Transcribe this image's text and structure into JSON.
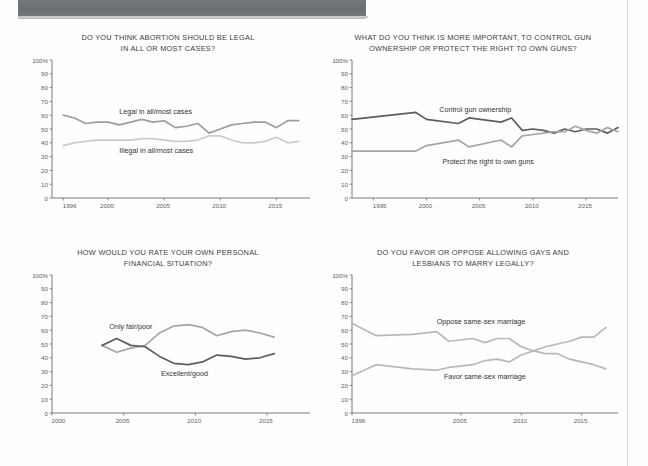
{
  "page": {
    "banner_color": "#6f7376",
    "background": "#ffffff"
  },
  "charts": [
    {
      "id": "abortion-legal",
      "title": "DO YOU THINK ABORTION SHOULD BE LEGAL\nIN ALL OR MOST CASES?",
      "y_ticks": [
        "100%",
        "90",
        "80",
        "70",
        "60",
        "50",
        "40",
        "30",
        "20",
        "10",
        "0"
      ],
      "x_ticks": [
        "1996",
        "2000",
        "2005",
        "2010",
        "2015"
      ],
      "chart_data": {
        "type": "line",
        "title": "DO YOU THINK ABORTION SHOULD BE LEGAL IN ALL OR MOST CASES?",
        "xlabel": "",
        "ylabel": "",
        "xlim": [
          1995,
          2018
        ],
        "ylim": [
          0,
          100
        ],
        "grid": false,
        "legend": "inline-labels",
        "x_ticks": [
          1996,
          2000,
          2005,
          2010,
          2015
        ],
        "y_ticks": [
          0,
          10,
          20,
          30,
          40,
          50,
          60,
          70,
          80,
          90,
          100
        ],
        "series": [
          {
            "name": "Legal in all/most cases",
            "color": "#9a9ea1",
            "label_x": 2001.0,
            "label_y": 62,
            "x": [
              1996,
              1997,
              1998,
              1999,
              2000,
              2001,
              2002,
              2003,
              2004,
              2005,
              2006,
              2007,
              2008,
              2009,
              2010,
              2011,
              2012,
              2013,
              2014,
              2015,
              2016,
              2017
            ],
            "values": [
              60,
              58,
              54,
              55,
              55,
              53,
              55,
              57,
              55,
              56,
              51,
              52,
              54,
              47,
              50,
              53,
              54,
              55,
              55,
              51,
              56,
              56
            ]
          },
          {
            "name": "Illegal in all/most cases",
            "color": "#c9cbce",
            "label_x": 2001.0,
            "label_y": 34,
            "x": [
              1996,
              1997,
              1998,
              1999,
              2000,
              2001,
              2002,
              2003,
              2004,
              2005,
              2006,
              2007,
              2008,
              2009,
              2010,
              2011,
              2012,
              2013,
              2014,
              2015,
              2016,
              2017
            ],
            "values": [
              38,
              40,
              41,
              42,
              42,
              42,
              42,
              43,
              43,
              42,
              41,
              41,
              42,
              45,
              45,
              42,
              40,
              40,
              41,
              44,
              40,
              41
            ]
          }
        ]
      }
    },
    {
      "id": "gun-control",
      "title": "WHAT DO YOU THINK IS MORE IMPORTANT, TO CONTROL GUN\nOWNERSHIP OR PROTECT THE RIGHT TO OWN GUNS?",
      "y_ticks": [
        "100%",
        "90",
        "80",
        "70",
        "60",
        "50",
        "40",
        "30",
        "20",
        "10",
        "0"
      ],
      "x_ticks": [
        "1995",
        "2000",
        "2005",
        "2010",
        "2015"
      ],
      "chart_data": {
        "type": "line",
        "title": "WHAT DO YOU THINK IS MORE IMPORTANT, TO CONTROL GUN OWNERSHIP OR PROTECT THE RIGHT TO OWN GUNS?",
        "xlabel": "",
        "ylabel": "",
        "xlim": [
          1993,
          2018
        ],
        "ylim": [
          0,
          100
        ],
        "grid": false,
        "legend": "inline-labels",
        "x_ticks": [
          1995,
          2000,
          2005,
          2010,
          2015
        ],
        "y_ticks": [
          0,
          10,
          20,
          30,
          40,
          50,
          60,
          70,
          80,
          90,
          100
        ],
        "series": [
          {
            "name": "Control gun ownership",
            "color": "#5b5e61",
            "label_x": 2001.2,
            "label_y": 64,
            "x": [
              1993,
              1999,
              2000,
              2003,
              2004,
              2007,
              2008,
              2009,
              2010,
              2011,
              2012,
              2013,
              2014,
              2015,
              2016,
              2017,
              2018
            ],
            "values": [
              57,
              62,
              57,
              54,
              58,
              55,
              58,
              49,
              50,
              49,
              47,
              50,
              48,
              50,
              50,
              47,
              51
            ]
          },
          {
            "name": "Protect the right to own guns",
            "color": "#a3a6a9",
            "label_x": 2001.5,
            "label_y": 26,
            "x": [
              1993,
              1999,
              2000,
              2003,
              2004,
              2007,
              2008,
              2009,
              2010,
              2011,
              2012,
              2013,
              2014,
              2015,
              2016,
              2017,
              2018
            ],
            "values": [
              34,
              34,
              38,
              42,
              37,
              42,
              37,
              45,
              46,
              47,
              48,
              48,
              52,
              49,
              47,
              51,
              48
            ]
          }
        ]
      }
    },
    {
      "id": "personal-finances",
      "title": "HOW WOULD YOU RATE YOUR OWN PERSONAL\nFINANCIAL SITUATION?",
      "y_ticks": [
        "100%",
        "90",
        "80",
        "70",
        "60",
        "50",
        "40",
        "30",
        "20",
        "10",
        "0"
      ],
      "x_ticks": [
        "2000",
        "2005",
        "2010",
        "2015"
      ],
      "chart_data": {
        "type": "line",
        "title": "HOW WOULD YOU RATE YOUR OWN PERSONAL FINANCIAL SITUATION?",
        "xlabel": "",
        "ylabel": "",
        "xlim": [
          2000,
          2018
        ],
        "ylim": [
          0,
          100
        ],
        "grid": false,
        "legend": "inline-labels",
        "x_ticks": [
          2000,
          2005,
          2010,
          2015
        ],
        "y_ticks": [
          0,
          10,
          20,
          30,
          40,
          50,
          60,
          70,
          80,
          90,
          100
        ],
        "series": [
          {
            "name": "Only fair/poor",
            "color": "#a3a6a9",
            "label_x": 2004.0,
            "label_y": 62,
            "x": [
              2003.5,
              2004.5,
              2005.5,
              2006.5,
              2007.5,
              2008.5,
              2009.5,
              2010.5,
              2011.5,
              2012.5,
              2013.5,
              2014.5,
              2015.5
            ],
            "values": [
              49,
              44,
              47,
              49,
              58,
              63,
              64,
              62,
              56,
              59,
              60,
              58,
              55
            ]
          },
          {
            "name": "Excellent/good",
            "color": "#5b5e61",
            "label_x": 2007.6,
            "label_y": 28,
            "x": [
              2003.5,
              2004.5,
              2005.5,
              2006.5,
              2007.5,
              2008.5,
              2009.5,
              2010.5,
              2011.5,
              2012.5,
              2013.5,
              2014.5,
              2015.5
            ],
            "values": [
              49,
              54,
              49,
              48,
              41,
              36,
              35,
              37,
              42,
              41,
              39,
              40,
              43
            ]
          }
        ]
      }
    },
    {
      "id": "same-sex-marriage",
      "title": "DO YOU FAVOR OR OPPOSE ALLOWING GAYS AND\nLESBIANS TO MARRY LEGALLY?",
      "y_ticks": [
        "100%",
        "90",
        "80",
        "70",
        "60",
        "50",
        "40",
        "30",
        "20",
        "10",
        "0"
      ],
      "x_ticks": [
        "1996",
        "2005",
        "2010",
        "2015"
      ],
      "chart_data": {
        "type": "line",
        "title": "DO YOU FAVOR OR OPPOSE ALLOWING GAYS AND LESBIANS TO MARRY LEGALLY?",
        "xlabel": "",
        "ylabel": "",
        "xlim": [
          1996,
          2018
        ],
        "ylim": [
          0,
          100
        ],
        "grid": false,
        "legend": "inline-labels",
        "x_ticks": [
          1996,
          2005,
          2010,
          2015
        ],
        "y_ticks": [
          0,
          10,
          20,
          30,
          40,
          50,
          60,
          70,
          80,
          90,
          100
        ],
        "series": [
          {
            "name": "Oppose same-sex marriage",
            "color": "#b6b9bc",
            "label_x": 2003.0,
            "label_y": 66,
            "x": [
              1996,
              1998,
              2001,
              2003,
              2004,
              2006,
              2007,
              2008,
              2009,
              2010,
              2011,
              2012,
              2013,
              2014,
              2015,
              2016,
              2017
            ],
            "values": [
              65,
              56,
              57,
              59,
              52,
              54,
              51,
              54,
              54,
              48,
              45,
              43,
              43,
              39,
              37,
              35,
              32
            ]
          },
          {
            "name": "Favor same-sex marriage",
            "color": "#b6b9bc",
            "label_x": 2003.6,
            "label_y": 26,
            "x": [
              1996,
              1998,
              2001,
              2003,
              2004,
              2006,
              2007,
              2008,
              2009,
              2010,
              2011,
              2012,
              2013,
              2014,
              2015,
              2016,
              2017
            ],
            "values": [
              27,
              35,
              32,
              31,
              33,
              35,
              38,
              39,
              37,
              42,
              45,
              48,
              50,
              52,
              55,
              55,
              62
            ]
          }
        ]
      }
    }
  ]
}
